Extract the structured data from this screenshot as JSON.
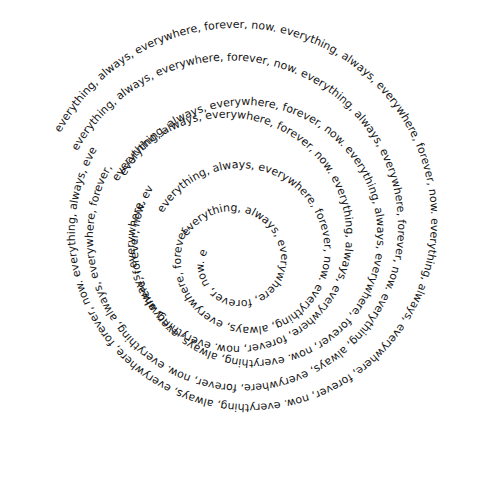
{
  "artwork": {
    "phrase": "everything, always, everywhere, forever, now. ",
    "words": [
      "everything,",
      "always,",
      "everywhere,",
      "forever,",
      "now."
    ],
    "background_color": "#ffffff",
    "text_color": "#151515",
    "layout": "concentric spiral text, clockwise, multiple overlapping rings",
    "rings": [
      {
        "name": "outer-spiral",
        "cx": 243,
        "cy": 226,
        "r_start": 205,
        "r_end": 165,
        "turns": 1
      },
      {
        "name": "second-spiral",
        "cx": 236,
        "cy": 232,
        "r_start": 178,
        "r_end": 140,
        "turns": 1
      },
      {
        "name": "middle-spiral-a",
        "cx": 250,
        "cy": 240,
        "r_start": 140,
        "r_end": 110,
        "turns": 1
      },
      {
        "name": "middle-spiral-b",
        "cx": 232,
        "cy": 240,
        "r_start": 128,
        "r_end": 95,
        "turns": 1
      },
      {
        "name": "inner-spiral-a",
        "cx": 245,
        "cy": 255,
        "r_start": 92,
        "r_end": 62,
        "turns": 1
      },
      {
        "name": "inner-spiral-b",
        "cx": 236,
        "cy": 262,
        "r_start": 55,
        "r_end": 30,
        "turns": 1
      }
    ]
  }
}
